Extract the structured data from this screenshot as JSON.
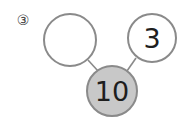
{
  "problem": {
    "number_label": "③"
  },
  "number_bond": {
    "whole": {
      "value": "10",
      "fill": "#c8c8c8",
      "stroke": "#8a8a8a"
    },
    "parts": [
      {
        "value": "",
        "fill": "#ffffff",
        "stroke": "#8a8a8a"
      },
      {
        "value": "3",
        "fill": "#ffffff",
        "stroke": "#8a8a8a"
      }
    ]
  }
}
